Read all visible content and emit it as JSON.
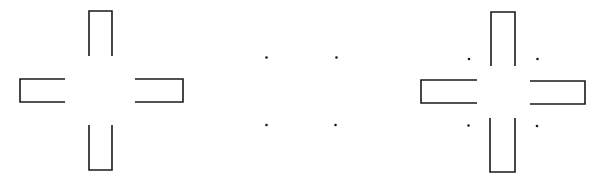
{
  "figure": {
    "stroke_color": "#1a1a1a",
    "background": "#ffffff",
    "panels": [
      {
        "name": "cross-arms",
        "description": "Four open-ended rectangular arms arranged as a cross"
      },
      {
        "name": "four-dots",
        "description": "Four dots at corners of a square"
      },
      {
        "name": "cross-with-dots",
        "description": "Cross arms combined with four dots"
      }
    ]
  }
}
